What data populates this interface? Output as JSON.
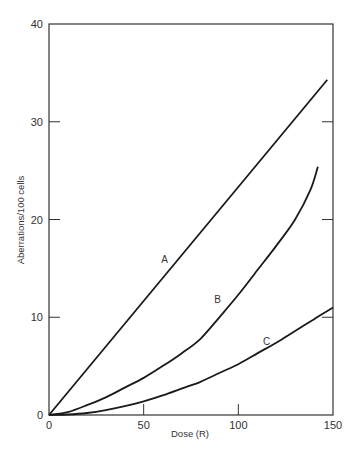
{
  "chart_data": {
    "type": "line",
    "title": "",
    "xlabel": "Dose (R)",
    "ylabel": "Aberrations/100 cells",
    "xlim": [
      0,
      150
    ],
    "ylim": [
      0,
      40
    ],
    "xticks": [
      0,
      50,
      100,
      150
    ],
    "yticks": [
      0,
      10,
      20,
      30,
      40
    ],
    "grid": false,
    "legend": "none (curves labeled inline A, B, C)",
    "series": [
      {
        "name": "A",
        "x": [
          0,
          147
        ],
        "y": [
          0,
          34.3
        ]
      },
      {
        "name": "B",
        "x": [
          0,
          10,
          20,
          30,
          40,
          50,
          60,
          70,
          80,
          90,
          100,
          110,
          120,
          130,
          138,
          142
        ],
        "y": [
          0,
          0.3,
          1.0,
          1.8,
          2.8,
          3.8,
          5.0,
          6.3,
          7.8,
          10.0,
          12.3,
          14.8,
          17.3,
          20.0,
          23.0,
          25.4
        ]
      },
      {
        "name": "C",
        "x": [
          0,
          10,
          20,
          30,
          40,
          50,
          60,
          70,
          80,
          90,
          100,
          110,
          120,
          130,
          140,
          150
        ],
        "y": [
          0,
          0.05,
          0.2,
          0.5,
          0.9,
          1.4,
          2.0,
          2.7,
          3.4,
          4.3,
          5.2,
          6.3,
          7.4,
          8.6,
          9.8,
          11.0
        ]
      }
    ],
    "annotations": [
      {
        "text": "A",
        "x": 61,
        "y": 15.5
      },
      {
        "text": "B",
        "x": 89,
        "y": 11.5
      },
      {
        "text": "C",
        "x": 115,
        "y": 7.2
      }
    ]
  },
  "labels": {
    "xlabel": "Dose (R)",
    "ylabel": "Aberrations/100 cells",
    "xticks": [
      "0",
      "50",
      "100",
      "150"
    ],
    "yticks": [
      "0",
      "10",
      "20",
      "30",
      "40"
    ],
    "curves": [
      "A",
      "B",
      "C"
    ]
  }
}
